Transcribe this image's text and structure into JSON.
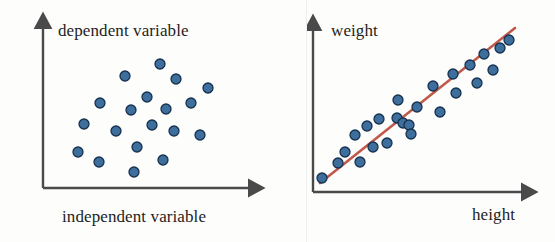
{
  "figure": {
    "background_color": "#fdfdfc",
    "width": 555,
    "height": 242
  },
  "style": {
    "point_fill": "#3d6e9c",
    "point_stroke": "#16314f",
    "point_radius": 5.0,
    "point_stroke_width": 1.3,
    "axis_color": "#4a4a4a",
    "axis_width": 2.4,
    "line_color": "#c1594a",
    "line_width": 2.6,
    "text_color": "#1d1d1d"
  },
  "panels": {
    "left": {
      "name": "no-correlation-scatter",
      "ylabel": "dependent variable",
      "xlabel": "independent variable",
      "axis": {
        "x_origin": 43,
        "y_origin": 188,
        "x_end": 255,
        "y_end": 22
      }
    },
    "right": {
      "name": "positive-correlation-scatter-with-fit",
      "ylabel": "weight",
      "xlabel": "height",
      "axis": {
        "x_origin": 6,
        "y_origin": 192,
        "x_end": 221,
        "y_end": 24
      },
      "fit_line": {
        "x1": 13,
        "y1": 183,
        "x2": 208,
        "y2": 28
      }
    }
  },
  "chart_data": [
    {
      "type": "scatter",
      "title": "",
      "xlabel": "independent variable",
      "ylabel": "dependent variable",
      "grid": false,
      "legend": false,
      "axes_style": "arrow-axes, no tick marks, no tick labels",
      "relationship": "no correlation",
      "xlim": [
        43,
        255
      ],
      "ylim": [
        22,
        188
      ],
      "note": "Point coordinates are in pixel space of the left panel (origin top-left of the 555x242 figure).",
      "points": [
        {
          "x": 160,
          "y": 64
        },
        {
          "x": 125,
          "y": 76
        },
        {
          "x": 176,
          "y": 79
        },
        {
          "x": 208,
          "y": 88
        },
        {
          "x": 100,
          "y": 103
        },
        {
          "x": 147,
          "y": 97
        },
        {
          "x": 191,
          "y": 103
        },
        {
          "x": 131,
          "y": 110
        },
        {
          "x": 166,
          "y": 109
        },
        {
          "x": 84,
          "y": 124
        },
        {
          "x": 152,
          "y": 125
        },
        {
          "x": 116,
          "y": 131
        },
        {
          "x": 174,
          "y": 131
        },
        {
          "x": 200,
          "y": 135
        },
        {
          "x": 137,
          "y": 147
        },
        {
          "x": 78,
          "y": 152
        },
        {
          "x": 99,
          "y": 162
        },
        {
          "x": 163,
          "y": 160
        },
        {
          "x": 134,
          "y": 172
        }
      ]
    },
    {
      "type": "scatter",
      "title": "",
      "xlabel": "height",
      "ylabel": "weight",
      "grid": false,
      "legend": false,
      "axes_style": "arrow-axes, no tick marks, no tick labels",
      "relationship": "strong positive linear correlation",
      "xlim": [
        6,
        221
      ],
      "ylim": [
        24,
        192
      ],
      "note": "Point coordinates are in pixel space of the right panel (origin at x=307 of the 555x242 figure). A red least-squares fit line is drawn through the cloud.",
      "points": [
        {
          "x": 15,
          "y": 178
        },
        {
          "x": 38,
          "y": 152
        },
        {
          "x": 31,
          "y": 163
        },
        {
          "x": 53,
          "y": 162
        },
        {
          "x": 48,
          "y": 135
        },
        {
          "x": 66,
          "y": 147
        },
        {
          "x": 80,
          "y": 143
        },
        {
          "x": 60,
          "y": 126
        },
        {
          "x": 72,
          "y": 119
        },
        {
          "x": 90,
          "y": 118
        },
        {
          "x": 96,
          "y": 123
        },
        {
          "x": 102,
          "y": 125
        },
        {
          "x": 91,
          "y": 100
        },
        {
          "x": 110,
          "y": 107
        },
        {
          "x": 104,
          "y": 134
        },
        {
          "x": 126,
          "y": 86
        },
        {
          "x": 133,
          "y": 112
        },
        {
          "x": 146,
          "y": 74
        },
        {
          "x": 149,
          "y": 93
        },
        {
          "x": 163,
          "y": 65
        },
        {
          "x": 170,
          "y": 83
        },
        {
          "x": 177,
          "y": 54
        },
        {
          "x": 186,
          "y": 70
        },
        {
          "x": 193,
          "y": 48
        },
        {
          "x": 202,
          "y": 40
        }
      ],
      "fit_line": {
        "label": "regression line",
        "color": "#c1594a",
        "x": [
          13,
          208
        ],
        "y": [
          183,
          28
        ]
      }
    }
  ]
}
